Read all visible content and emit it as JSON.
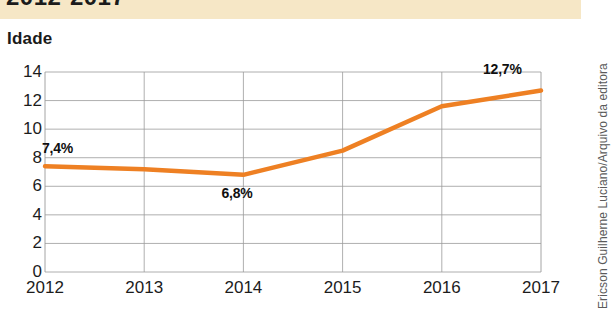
{
  "header": {
    "title_cut": "2012-2017",
    "band_color": "#f6e7c6"
  },
  "axis_title": "Idade",
  "credit": "Ericson Guilherne Luciano/Arquivo da editora",
  "colors": {
    "line": "#ee8023",
    "grid": "#9a9a9a",
    "text": "#1c1c1c",
    "plot_bg": "#ffffff"
  },
  "chart_data": {
    "type": "line",
    "title": "2012-2017",
    "xlabel": "",
    "ylabel": "Idade",
    "x": [
      "2012",
      "2013",
      "2014",
      "2015",
      "2016",
      "2017"
    ],
    "categories": [
      "2012",
      "2013",
      "2014",
      "2015",
      "2016",
      "2017"
    ],
    "values": [
      7.4,
      7.2,
      6.8,
      8.5,
      11.6,
      12.7
    ],
    "series": [
      {
        "name": "Idade",
        "values": [
          7.4,
          7.2,
          6.8,
          8.5,
          11.6,
          12.7
        ]
      }
    ],
    "ylim": [
      0,
      14
    ],
    "yticks": [
      0,
      2,
      4,
      6,
      8,
      10,
      12,
      14
    ],
    "ytick_labels": [
      "0",
      "2",
      "4",
      "6",
      "8",
      "10",
      "12",
      "14"
    ],
    "grid": true,
    "legend": "none",
    "annotations": [
      {
        "text": "7,4%",
        "x": "2012",
        "y": 7.4
      },
      {
        "text": "6,8%",
        "x": "2014",
        "y": 6.8
      },
      {
        "text": "12,7%",
        "x": "2017",
        "y": 12.7
      }
    ]
  }
}
